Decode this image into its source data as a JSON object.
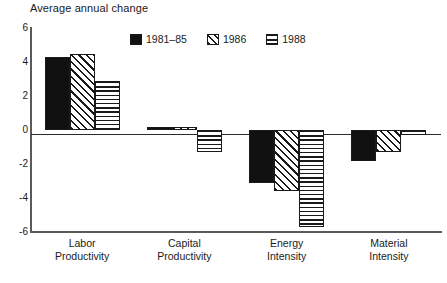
{
  "chart_data": {
    "type": "bar",
    "title": "Average annual change",
    "xlabel": "",
    "ylabel": "Average annual change",
    "ylim": [
      -6,
      6
    ],
    "yticks": [
      "6",
      "4",
      "2",
      "0",
      "-2",
      "-4",
      "-6"
    ],
    "ytick_values": [
      6,
      4,
      2,
      0,
      -2,
      -4,
      -6
    ],
    "grid": false,
    "legend_position": "top-center-inside",
    "categories": [
      "Labor Productivity",
      "Capital Productivity",
      "Energy Intensity",
      "Material Intensity"
    ],
    "category_lines": [
      [
        "Labor",
        "Productivity"
      ],
      [
        "Capital",
        "Productivity"
      ],
      [
        "Energy",
        "Intensity"
      ],
      [
        "Material",
        "Intensity"
      ]
    ],
    "series": [
      {
        "name": "1981–85",
        "pattern": "solid-black",
        "values": [
          4.3,
          0.15,
          -3.1,
          -1.8
        ]
      },
      {
        "name": "1986",
        "pattern": "diagonal-hatch",
        "values": [
          4.5,
          0.15,
          -3.6,
          -1.3
        ]
      },
      {
        "name": "1988",
        "pattern": "horizontal-lines",
        "values": [
          2.9,
          -1.3,
          -5.7,
          -0.3
        ]
      }
    ]
  },
  "legend": {
    "items": [
      {
        "label": "1981–85",
        "swatch": "solid-black-swatch"
      },
      {
        "label": "1986",
        "swatch": "diagonal-hatch-swatch"
      },
      {
        "label": "1988",
        "swatch": "horizontal-lines-swatch"
      }
    ]
  },
  "colors": {
    "bar_outline": "#1a1a1a",
    "bar_solid": "#111111",
    "axis": "#5a5a5a",
    "frame": "#8a8a8a",
    "text": "#1a1a1a",
    "background": "#ffffff"
  },
  "caption": {
    "text": ""
  }
}
